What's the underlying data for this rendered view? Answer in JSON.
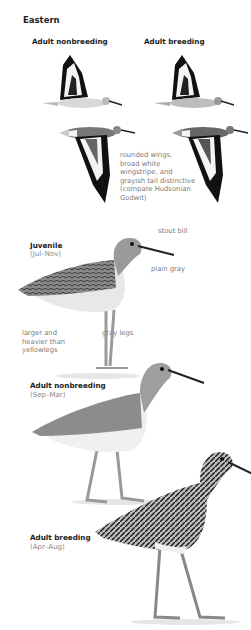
{
  "page": {
    "section_title": "Eastern"
  },
  "flight": {
    "left_label": "Adult nonbreeding",
    "right_label": "Adult breeding",
    "note_lines": [
      "rounded wings,",
      "broad white",
      "wingstripe, and",
      "grayish tail distinctive",
      "(compare Hudsonian",
      "Godwit)"
    ]
  },
  "juvenile": {
    "label": "Juvenile",
    "season": "(Jul–Nov)",
    "notes": {
      "bill": "stout bill",
      "breast": "plain gray",
      "size_lines": [
        "larger and",
        "heavier than",
        "yellowlegs"
      ],
      "legs": "gray legs"
    }
  },
  "adult_nonbreeding": {
    "label": "Adult nonbreeding",
    "season": "(Sep–Mar)"
  },
  "adult_breeding": {
    "label": "Adult breeding",
    "season": "(Apr–Aug)"
  },
  "colors": {
    "text_dark": "#222222",
    "text_gray": "#888888",
    "bird_gray": "#9a9a9a",
    "bird_dark": "#1a1a1a"
  }
}
